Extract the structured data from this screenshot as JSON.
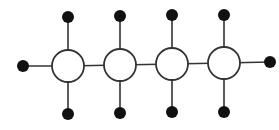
{
  "diagram": {
    "type": "chain-graph",
    "colors": {
      "stroke": "#333333",
      "node_fill": "#111111",
      "circle_fill": "#ffffff",
      "background": "#ffffff"
    },
    "open_circles": [
      {
        "cx": 68,
        "cy": 66,
        "r": 16
      },
      {
        "cx": 120,
        "cy": 65,
        "r": 16
      },
      {
        "cx": 172,
        "cy": 64,
        "r": 16
      },
      {
        "cx": 224,
        "cy": 63,
        "r": 16
      }
    ],
    "black_nodes": [
      {
        "cx": 68,
        "cy": 17,
        "r": 6
      },
      {
        "cx": 68,
        "cy": 114,
        "r": 6
      },
      {
        "cx": 120,
        "cy": 16,
        "r": 6
      },
      {
        "cx": 120,
        "cy": 113,
        "r": 6
      },
      {
        "cx": 172,
        "cy": 15,
        "r": 6
      },
      {
        "cx": 172,
        "cy": 112,
        "r": 6
      },
      {
        "cx": 224,
        "cy": 15,
        "r": 6
      },
      {
        "cx": 224,
        "cy": 112,
        "r": 6
      },
      {
        "cx": 23,
        "cy": 66,
        "r": 6
      },
      {
        "cx": 270,
        "cy": 62,
        "r": 6
      }
    ]
  }
}
